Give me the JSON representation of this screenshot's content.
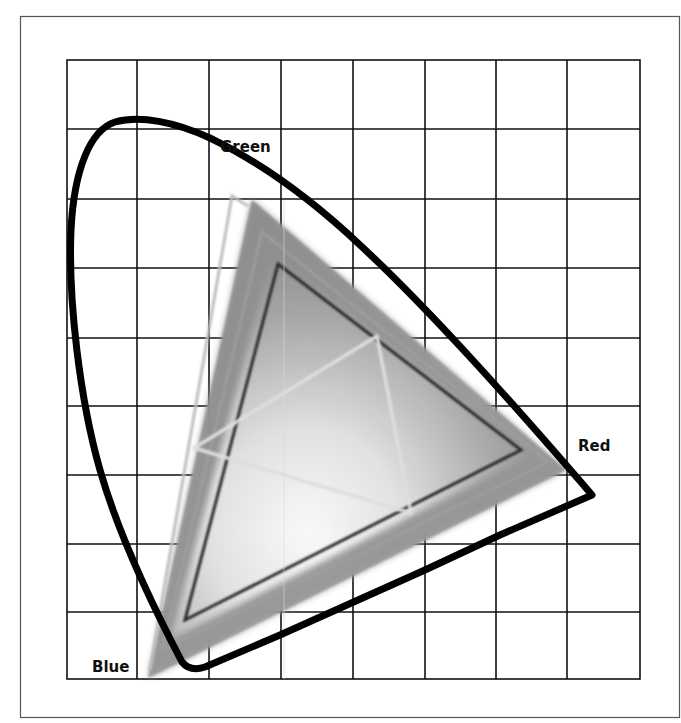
{
  "diagram": {
    "type": "chromaticity-gamut-diagram",
    "labels": {
      "green": "Green",
      "red": "Red",
      "blue": "Blue"
    },
    "grid": {
      "columns": 8,
      "rows": 9,
      "line_color": "#111111"
    },
    "frame": {
      "border_color": "#555555",
      "background": "#ffffff"
    },
    "shapes": [
      {
        "name": "spectral-locus",
        "description": "horseshoe-shaped spectral locus outline",
        "stroke": "#000000",
        "stroke_width": 7
      },
      {
        "name": "large-gamut-triangle",
        "description": "large shaded gray gamut triangle",
        "fill": "#8a8a8a"
      },
      {
        "name": "light-outline-triangle",
        "description": "light gray outlined gamut triangle",
        "stroke": "#bdbdbd"
      },
      {
        "name": "dark-inner-triangle",
        "description": "dark outlined inner gamut triangle",
        "stroke": "#2a2a2a"
      },
      {
        "name": "small-light-triangle",
        "description": "small light gray gamut triangle",
        "stroke": "#d9d9d9"
      }
    ]
  }
}
